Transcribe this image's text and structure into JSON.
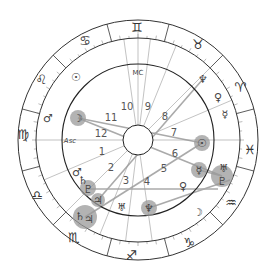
{
  "chart": {
    "type": "natal-astrology-wheel",
    "center": [
      138,
      140
    ],
    "radii": {
      "outer": 120,
      "zodiac_inner": 102,
      "house_ring": 76,
      "core": 15
    },
    "colors": {
      "line": "#333333",
      "aspect": "#aaaaaa",
      "highlight": "#9a9a9a",
      "text": "#444444"
    },
    "angles": {
      "mc_label": "MC",
      "asc_label": "Asc"
    },
    "zodiac_signs": [
      {
        "name": "Gemini",
        "glyph": "♊",
        "x": 137,
        "y": 28
      },
      {
        "name": "Taurus",
        "glyph": "♉",
        "x": 198,
        "y": 45
      },
      {
        "name": "Aries",
        "glyph": "♈",
        "x": 240,
        "y": 88
      },
      {
        "name": "Pisces",
        "glyph": "♓",
        "x": 250,
        "y": 150
      },
      {
        "name": "Aquarius",
        "glyph": "♒",
        "x": 231,
        "y": 203
      },
      {
        "name": "Capricorn",
        "glyph": "♑",
        "x": 189,
        "y": 243
      },
      {
        "name": "Sagittarius",
        "glyph": "♐",
        "x": 131,
        "y": 256
      },
      {
        "name": "Scorpio",
        "glyph": "♏",
        "x": 74,
        "y": 238
      },
      {
        "name": "Libra",
        "glyph": "♎",
        "x": 37,
        "y": 196
      },
      {
        "name": "Virgo",
        "glyph": "♍",
        "x": 23,
        "y": 135
      },
      {
        "name": "Leo",
        "glyph": "♌",
        "x": 41,
        "y": 80
      },
      {
        "name": "Cancer",
        "glyph": "♋",
        "x": 85,
        "y": 41
      }
    ],
    "houses": [
      {
        "num": "1",
        "x": 102,
        "y": 152
      },
      {
        "num": "2",
        "x": 111,
        "y": 168
      },
      {
        "num": "3",
        "x": 126,
        "y": 181
      },
      {
        "num": "4",
        "x": 147,
        "y": 182
      },
      {
        "num": "5",
        "x": 164,
        "y": 169
      },
      {
        "num": "6",
        "x": 175,
        "y": 154
      },
      {
        "num": "7",
        "x": 174,
        "y": 133
      },
      {
        "num": "8",
        "x": 165,
        "y": 117
      },
      {
        "name": "9",
        "num": "9",
        "x": 148,
        "y": 107
      },
      {
        "num": "10",
        "x": 127,
        "y": 107
      },
      {
        "num": "11",
        "x": 111,
        "y": 118
      },
      {
        "num": "12",
        "x": 101,
        "y": 134
      }
    ],
    "planets": [
      {
        "name": "Sun",
        "glyph": "☉",
        "x": 76,
        "y": 77,
        "highlight": false
      },
      {
        "name": "Mars",
        "glyph": "♂",
        "x": 48,
        "y": 118,
        "highlight": false
      },
      {
        "name": "Moon",
        "glyph": "☽",
        "x": 78,
        "y": 118,
        "highlight": true
      },
      {
        "name": "Neptune",
        "glyph": "♆",
        "x": 203,
        "y": 79,
        "highlight": false
      },
      {
        "name": "Venus",
        "glyph": "♀",
        "x": 218,
        "y": 97,
        "highlight": false
      },
      {
        "name": "Mercury",
        "glyph": "☿",
        "x": 225,
        "y": 114,
        "highlight": false
      },
      {
        "name": "Sun",
        "glyph": "☉",
        "x": 202,
        "y": 143,
        "highlight": true
      },
      {
        "name": "Mercury",
        "glyph": "☿",
        "x": 199,
        "y": 170,
        "highlight": true
      },
      {
        "name": "Uranus",
        "glyph": "♅",
        "x": 224,
        "y": 168,
        "highlight": false
      },
      {
        "name": "Pluto",
        "glyph": "♇",
        "x": 222,
        "y": 181,
        "highlight": true
      },
      {
        "name": "Venus",
        "glyph": "♀",
        "x": 183,
        "y": 186,
        "highlight": false
      },
      {
        "name": "Moon",
        "glyph": "☽",
        "x": 198,
        "y": 212,
        "highlight": false
      },
      {
        "name": "Neptune",
        "glyph": "♆",
        "x": 149,
        "y": 208,
        "highlight": true
      },
      {
        "name": "Uranus",
        "glyph": "♅",
        "x": 122,
        "y": 207,
        "highlight": false
      },
      {
        "name": "Mars",
        "glyph": "♂",
        "x": 77,
        "y": 172,
        "highlight": false
      },
      {
        "name": "Saturn",
        "glyph": "♄",
        "x": 83,
        "y": 180,
        "highlight": false
      },
      {
        "name": "Pluto",
        "glyph": "♇",
        "x": 88,
        "y": 189,
        "highlight": true
      },
      {
        "name": "Jupiter",
        "glyph": "♃",
        "x": 98,
        "y": 200,
        "highlight": true
      },
      {
        "name": "Saturn",
        "glyph": "♄",
        "x": 80,
        "y": 216,
        "highlight": true
      },
      {
        "name": "Jupiter",
        "glyph": "♃",
        "x": 89,
        "y": 219,
        "highlight": true
      }
    ],
    "highlight_halos": [
      {
        "x": 78,
        "y": 118,
        "r": 8
      },
      {
        "x": 202,
        "y": 143,
        "r": 8
      },
      {
        "x": 199,
        "y": 170,
        "r": 8
      },
      {
        "x": 222,
        "y": 176,
        "r": 11
      },
      {
        "x": 149,
        "y": 208,
        "r": 8
      },
      {
        "x": 88,
        "y": 188,
        "r": 8
      },
      {
        "x": 98,
        "y": 200,
        "r": 7
      },
      {
        "x": 85,
        "y": 217,
        "r": 12
      }
    ],
    "aspect_lines": [
      {
        "x1": 78,
        "y1": 118,
        "x2": 222,
        "y2": 176
      },
      {
        "x1": 78,
        "y1": 118,
        "x2": 202,
        "y2": 143
      },
      {
        "x1": 88,
        "y1": 189,
        "x2": 218,
        "y2": 189
      },
      {
        "x1": 85,
        "y1": 217,
        "x2": 202,
        "y2": 143
      },
      {
        "x1": 98,
        "y1": 200,
        "x2": 203,
        "y2": 79
      },
      {
        "x1": 149,
        "y1": 208,
        "x2": 230,
        "y2": 180
      },
      {
        "x1": 199,
        "y1": 170,
        "x2": 222,
        "y2": 176
      }
    ],
    "house_cusps_deg": [
      180,
      157,
      135,
      112,
      97,
      82,
      0,
      -23,
      -45,
      -68,
      -83,
      -98
    ],
    "ticks": "every 5 degrees on zodiac band"
  }
}
